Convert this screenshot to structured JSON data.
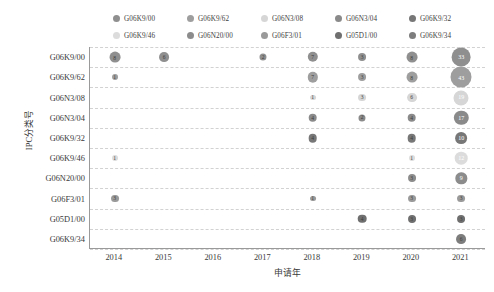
{
  "chart_data": {
    "type": "scatter",
    "subtype": "bubble",
    "title": "",
    "xlabel": "申请年",
    "ylabel": "IPC分类号",
    "x": [
      "2014",
      "2015",
      "2016",
      "2017",
      "2018",
      "2019",
      "2020",
      "2021"
    ],
    "categories": [
      "G06K9/00",
      "G06K9/62",
      "G06N3/08",
      "G06N3/04",
      "G06K9/32",
      "G06K9/46",
      "G06N20/00",
      "G06F3/01",
      "G05D1/00",
      "G06K9/34"
    ],
    "grid": true,
    "grid_style": "dashed-horizontal",
    "legend_position": "top",
    "legend": [
      {
        "label": "G06K9/00",
        "color": "#8f8f8f"
      },
      {
        "label": "G06K9/62",
        "color": "#9e9e9e"
      },
      {
        "label": "G06N3/08",
        "color": "#d6d6d6"
      },
      {
        "label": "G06N3/04",
        "color": "#8a8a8a"
      },
      {
        "label": "G06K9/32",
        "color": "#777777"
      },
      {
        "label": "G06K9/46",
        "color": "#dcdcdc"
      },
      {
        "label": "G06N20/00",
        "color": "#8c8c8c"
      },
      {
        "label": "G06F3/01",
        "color": "#9a9a9a"
      },
      {
        "label": "G05D1/00",
        "color": "#6f6f6f"
      },
      {
        "label": "G06K9/34",
        "color": "#7d7d7d"
      }
    ],
    "size_encoding": "value",
    "points": [
      {
        "category": "G06K9/00",
        "year": "2014",
        "value": 8,
        "color": "#8f8f8f"
      },
      {
        "category": "G06K9/00",
        "year": "2015",
        "value": 6,
        "color": "#8f8f8f"
      },
      {
        "category": "G06K9/00",
        "year": "2017",
        "value": 2,
        "color": "#8f8f8f"
      },
      {
        "category": "G06K9/00",
        "year": "2018",
        "value": 7,
        "color": "#8f8f8f"
      },
      {
        "category": "G06K9/00",
        "year": "2019",
        "value": 3,
        "color": "#8f8f8f"
      },
      {
        "category": "G06K9/00",
        "year": "2020",
        "value": 8,
        "color": "#8f8f8f"
      },
      {
        "category": "G06K9/00",
        "year": "2021",
        "value": 33,
        "color": "#8f8f8f"
      },
      {
        "category": "G06K9/62",
        "year": "2014",
        "value": 1,
        "color": "#9e9e9e"
      },
      {
        "category": "G06K9/62",
        "year": "2018",
        "value": 7,
        "color": "#9e9e9e"
      },
      {
        "category": "G06K9/62",
        "year": "2019",
        "value": 3,
        "color": "#9e9e9e"
      },
      {
        "category": "G06K9/62",
        "year": "2020",
        "value": 8,
        "color": "#9e9e9e"
      },
      {
        "category": "G06K9/62",
        "year": "2021",
        "value": 43,
        "color": "#9e9e9e"
      },
      {
        "category": "G06N3/08",
        "year": "2018",
        "value": 1,
        "color": "#d6d6d6"
      },
      {
        "category": "G06N3/08",
        "year": "2019",
        "value": 3,
        "color": "#d6d6d6"
      },
      {
        "category": "G06N3/08",
        "year": "2020",
        "value": 6,
        "color": "#d6d6d6"
      },
      {
        "category": "G06N3/08",
        "year": "2021",
        "value": 19,
        "color": "#d6d6d6"
      },
      {
        "category": "G06N3/04",
        "year": "2018",
        "value": 4,
        "color": "#8a8a8a"
      },
      {
        "category": "G06N3/04",
        "year": "2019",
        "value": 2,
        "color": "#8a8a8a"
      },
      {
        "category": "G06N3/04",
        "year": "2020",
        "value": 4,
        "color": "#8a8a8a"
      },
      {
        "category": "G06N3/04",
        "year": "2021",
        "value": 17,
        "color": "#8a8a8a"
      },
      {
        "category": "G06K9/32",
        "year": "2018",
        "value": 4,
        "color": "#777777"
      },
      {
        "category": "G06K9/32",
        "year": "2020",
        "value": 4,
        "color": "#777777"
      },
      {
        "category": "G06K9/32",
        "year": "2021",
        "value": 10,
        "color": "#777777"
      },
      {
        "category": "G06K9/46",
        "year": "2014",
        "value": 1,
        "color": "#dcdcdc"
      },
      {
        "category": "G06K9/46",
        "year": "2020",
        "value": 1,
        "color": "#dcdcdc"
      },
      {
        "category": "G06K9/46",
        "year": "2021",
        "value": 12,
        "color": "#dcdcdc"
      },
      {
        "category": "G06N20/00",
        "year": "2020",
        "value": 3,
        "color": "#8c8c8c"
      },
      {
        "category": "G06N20/00",
        "year": "2021",
        "value": 9,
        "color": "#8c8c8c"
      },
      {
        "category": "G06F3/01",
        "year": "2014",
        "value": 3,
        "color": "#9a9a9a"
      },
      {
        "category": "G06F3/01",
        "year": "2018",
        "value": 1,
        "color": "#9a9a9a"
      },
      {
        "category": "G06F3/01",
        "year": "2020",
        "value": 3,
        "color": "#9a9a9a"
      },
      {
        "category": "G06F3/01",
        "year": "2021",
        "value": 3,
        "color": "#9a9a9a"
      },
      {
        "category": "G05D1/00",
        "year": "2019",
        "value": 4,
        "color": "#6f6f6f"
      },
      {
        "category": "G05D1/00",
        "year": "2020",
        "value": 3,
        "color": "#6f6f6f"
      },
      {
        "category": "G05D1/00",
        "year": "2021",
        "value": 3,
        "color": "#6f6f6f"
      },
      {
        "category": "G06K9/34",
        "year": "2021",
        "value": 6,
        "color": "#7d7d7d"
      }
    ]
  }
}
